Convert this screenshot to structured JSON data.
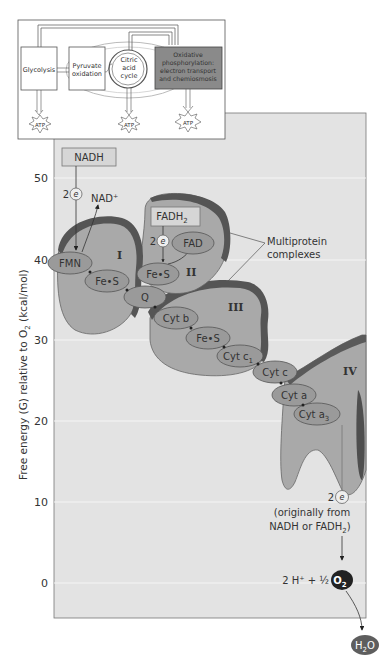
{
  "overview": {
    "stages": [
      {
        "label_lines": [
          "Glycolysis"
        ]
      },
      {
        "label_lines": [
          "Pyruvate",
          "oxidation"
        ]
      },
      {
        "label_lines": [
          "Citric",
          "acid",
          "cycle"
        ]
      },
      {
        "label_lines": [
          "Oxidative",
          "phosphorylation:",
          "electron transport",
          "and chemiosmosis"
        ]
      }
    ],
    "atp_label": "ATP"
  },
  "axis": {
    "ylabel": "Free energy (G) relative to O",
    "ylabel_sub": "2",
    "ylabel_units": " (kcal/mol)",
    "ticks": [
      "50",
      "40",
      "30",
      "20",
      "10",
      "0"
    ]
  },
  "carriers": {
    "nadh": "NADH",
    "nad_plus": "NAD⁺",
    "fadh2": "FADH",
    "fadh2_sub": "2",
    "fad": "FAD",
    "fmn": "FMN",
    "fes_1": "Fe•S",
    "fes_2": "Fe•S",
    "fes_3": "Fe•S",
    "q": "Q",
    "cyt_b": "Cyt b",
    "cyt_c1": "Cyt c",
    "cyt_c1_sub": "1",
    "cyt_c": "Cyt c",
    "cyt_a": "Cyt a",
    "cyt_a3": "Cyt a",
    "cyt_a3_sub": "3",
    "electrons_count": "2",
    "electron": "e",
    "electron_sup": "−"
  },
  "complexes": {
    "I": "I",
    "II": "II",
    "III": "III",
    "IV": "IV",
    "callout_line1": "Multiprotein",
    "callout_line2": "complexes"
  },
  "final": {
    "origin_line1": "(originally from",
    "origin_line2": "NADH or FADH",
    "origin_sub": "2",
    "origin_close": ")",
    "reactants": "2 H⁺ + ½",
    "o2": "O",
    "o2_sub": "2",
    "h2o_h": "H",
    "h2o_sub": "2",
    "h2o_o": "O"
  },
  "colors": {
    "panel_bg": "#e3e3e3",
    "complex_fill": "#a8a8a8",
    "complex_edge": "#5a5a5a",
    "carrier_fill": "#9a9a9a",
    "ox_phos_box": "#8a8a8a",
    "o2_fill": "#222222",
    "h2o_fill": "#5e5e5e"
  }
}
